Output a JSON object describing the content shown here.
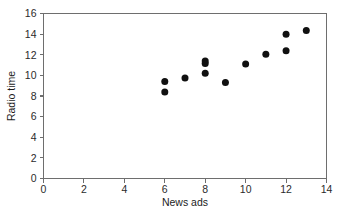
{
  "chart_data": {
    "type": "scatter",
    "title": "",
    "xlabel": "News ads",
    "ylabel": "Radio time",
    "xlim": [
      0,
      14
    ],
    "ylim": [
      0,
      16
    ],
    "xticks": [
      0,
      2,
      4,
      6,
      8,
      10,
      12,
      14
    ],
    "yticks": [
      0,
      2,
      4,
      6,
      8,
      10,
      12,
      14,
      16
    ],
    "grid": false,
    "legend": null,
    "marker": "filled-circle",
    "marker_color": "#101010",
    "points": [
      {
        "x": 6,
        "y": 9.4
      },
      {
        "x": 6,
        "y": 8.4
      },
      {
        "x": 7,
        "y": 9.75
      },
      {
        "x": 8,
        "y": 11.4
      },
      {
        "x": 8,
        "y": 11.15
      },
      {
        "x": 8,
        "y": 10.2
      },
      {
        "x": 9,
        "y": 9.3
      },
      {
        "x": 10,
        "y": 11.1
      },
      {
        "x": 11,
        "y": 12.05
      },
      {
        "x": 12,
        "y": 14.0
      },
      {
        "x": 12,
        "y": 12.4
      },
      {
        "x": 13,
        "y": 14.35
      }
    ]
  },
  "axes": {
    "x_tick_labels": [
      "0",
      "2",
      "4",
      "6",
      "8",
      "10",
      "12",
      "14"
    ],
    "y_tick_labels": [
      "0",
      "2",
      "4",
      "6",
      "8",
      "10",
      "12",
      "14",
      "16"
    ],
    "x_axis_title": "News ads",
    "y_axis_title": "Radio time"
  },
  "colors": {
    "axis": "#6e6e6e",
    "text": "#2b2b2b",
    "marker": "#101010",
    "background": "#ffffff"
  }
}
